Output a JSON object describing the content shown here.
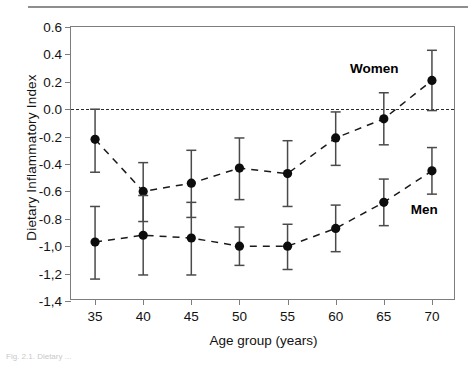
{
  "figure": {
    "caption_fragment": "Fig. 2.1. Dietary ..."
  },
  "chart_data": {
    "type": "scatter",
    "title": "",
    "xlabel": "Age group (years)",
    "ylabel": "Dietary Inflammatory Index",
    "x": [
      35,
      40,
      45,
      50,
      55,
      60,
      65,
      70
    ],
    "xtick_labels": [
      "35",
      "40",
      "45",
      "50",
      "55",
      "60",
      "65",
      "70"
    ],
    "ytick_labels": [
      "0.6",
      "0.4",
      "0.2",
      "0.0",
      "-0.2",
      "-0.4",
      "-0.6",
      "-0.8",
      "-1,0",
      "-1,2",
      "-1,4"
    ],
    "ytick_values": [
      0.6,
      0.4,
      0.2,
      0.0,
      -0.2,
      -0.4,
      -0.6,
      -0.8,
      -1.0,
      -1.2,
      -1.4
    ],
    "xlim": [
      32.5,
      72.5
    ],
    "ylim": [
      -1.4,
      0.6
    ],
    "grid": false,
    "legend": "inline-annotations",
    "reference_line": {
      "y": 0.0,
      "style": "dashed"
    },
    "marker": "filled-circle",
    "line_style": "dashed",
    "error_bars": "vertical",
    "series": [
      {
        "name": "Women",
        "values": [
          -0.22,
          -0.6,
          -0.54,
          -0.43,
          -0.47,
          -0.21,
          -0.07,
          0.21
        ],
        "err_low": [
          -0.46,
          -0.82,
          -0.79,
          -0.66,
          -0.71,
          -0.41,
          -0.26,
          -0.01
        ],
        "err_high": [
          0.0,
          -0.39,
          -0.3,
          -0.21,
          -0.23,
          -0.02,
          0.12,
          0.43
        ]
      },
      {
        "name": "Men",
        "values": [
          -0.97,
          -0.92,
          -0.94,
          -1.0,
          -1.0,
          -0.87,
          -0.68,
          -0.45
        ],
        "err_low": [
          -1.24,
          -1.21,
          -1.21,
          -1.14,
          -1.17,
          -1.04,
          -0.85,
          -0.62
        ],
        "err_high": [
          -0.71,
          -0.63,
          -0.68,
          -0.86,
          -0.84,
          -0.7,
          -0.51,
          -0.28
        ]
      }
    ],
    "annotations": [
      {
        "text": "Women",
        "x": 64.0,
        "y": 0.3
      },
      {
        "text": "Men",
        "x": 69.2,
        "y": -0.73
      }
    ]
  }
}
